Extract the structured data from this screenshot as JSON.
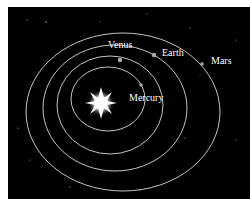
{
  "diagram": {
    "labels": {
      "venus": "Venus",
      "earth": "Earth",
      "mars": "Mars",
      "mercury": "Mercury"
    },
    "colors": {
      "background": "#000000",
      "orbit": "#d8d8d8",
      "text": "#ffffff",
      "sun": "#ffffff"
    }
  }
}
